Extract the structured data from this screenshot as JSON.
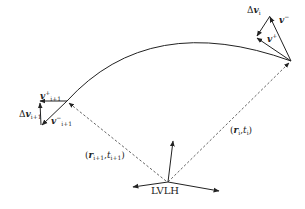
{
  "diagram": {
    "type": "trajectory-impulse-diagram",
    "frame_label": "LVLH",
    "nodes": [
      {
        "id": "node-i",
        "position_label": "(r_i, t_i)",
        "position_text": {
          "open": "(",
          "r": "r",
          "r_sub": "i",
          "comma": ",",
          "t": "t",
          "t_sub": "i",
          "close": ")"
        },
        "delta_v": {
          "prefix": "Δ",
          "v": "v",
          "sub": "i"
        },
        "v_minus": {
          "v": "v",
          "sub": "i",
          "sup": "−"
        },
        "v_plus": {
          "v": "v",
          "sub": "i",
          "sup": "+"
        }
      },
      {
        "id": "node-i-plus-1",
        "position_label": "(r_{i+1}, t_{i+1})",
        "position_text": {
          "open": "(",
          "r": "r",
          "r_sub": "i+1",
          "comma": ",",
          "t": "t",
          "t_sub": "i+1",
          "close": ")"
        },
        "delta_v": {
          "prefix": "Δ",
          "v": "v",
          "sub": "i+1"
        },
        "v_minus": {
          "v": "v",
          "sub": "i+1",
          "sup": "−"
        },
        "v_plus": {
          "v": "v",
          "sub": "i+1",
          "sup": "+"
        }
      }
    ],
    "colors": {
      "stroke": "#222222",
      "dashed": "#555555",
      "background": "#ffffff"
    }
  }
}
